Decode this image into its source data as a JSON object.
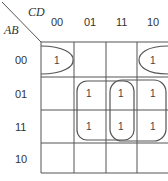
{
  "kmap": {
    "row_var": "AB",
    "col_var": "CD",
    "col_labels": [
      "00",
      "01",
      "11",
      "10"
    ],
    "row_labels": [
      "00",
      "01",
      "11",
      "10"
    ],
    "cells": [
      [
        "1",
        "",
        "",
        "1"
      ],
      [
        "",
        "1",
        "1",
        "1"
      ],
      [
        "",
        "1",
        "1",
        "1"
      ],
      [
        "",
        "",
        "",
        ""
      ]
    ],
    "groups": [
      {
        "name": "corner-wrap-group",
        "cells": [
          [
            0,
            0
          ],
          [
            0,
            3
          ]
        ]
      },
      {
        "name": "middle-group",
        "cells": [
          [
            1,
            1
          ],
          [
            1,
            2
          ],
          [
            2,
            1
          ],
          [
            2,
            2
          ]
        ]
      },
      {
        "name": "right-group",
        "cells": [
          [
            1,
            2
          ],
          [
            1,
            3
          ],
          [
            2,
            2
          ],
          [
            2,
            3
          ]
        ]
      }
    ],
    "line_color": "#555555"
  }
}
